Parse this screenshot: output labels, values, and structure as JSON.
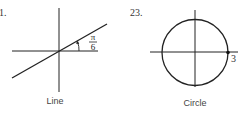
{
  "figures": [
    {
      "number": "1.",
      "caption": "Line",
      "angle_label": {
        "numerator": "π",
        "denominator": "6"
      },
      "angle_radians": 0.5236
    },
    {
      "number": "23.",
      "caption": "Circle",
      "radius_label": "3",
      "radius": 3
    }
  ],
  "colors": {
    "stroke": "#222222",
    "text": "#333333"
  }
}
